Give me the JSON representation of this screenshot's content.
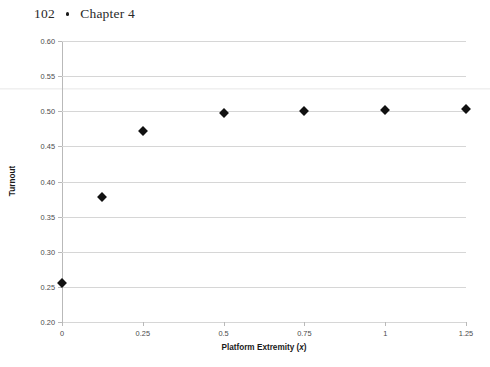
{
  "page_header": {
    "folio": "102",
    "separator_icon": "bullet-dot",
    "chapter_label": "Chapter 4"
  },
  "chart_data": {
    "type": "scatter",
    "title": "",
    "xlabel_prefix": "Platform Extremity (",
    "xlabel_variable": "x",
    "xlabel_suffix": ")",
    "ylabel": "Turnout",
    "x": [
      0,
      0.125,
      0.25,
      0.5,
      0.75,
      1.0,
      1.25
    ],
    "values": [
      0.255,
      0.378,
      0.472,
      0.498,
      0.5,
      0.502,
      0.503
    ],
    "xlim": [
      0,
      1.25
    ],
    "ylim": [
      0.2,
      0.6
    ],
    "xticks": [
      0,
      0.25,
      0.5,
      0.75,
      1,
      1.25
    ],
    "xtick_labels": [
      "0",
      "0.25",
      "0.5",
      "0.75",
      "1",
      "1.25"
    ],
    "yticks": [
      0.2,
      0.25,
      0.3,
      0.35,
      0.4,
      0.45,
      0.5,
      0.55,
      0.6
    ],
    "ytick_labels": [
      "0.20",
      "0.25",
      "0.30",
      "0.35",
      "0.40",
      "0.45",
      "0.50",
      "0.55",
      "0.60"
    ],
    "grid": "horizontal",
    "legend": "none",
    "marker": "diamond",
    "marker_color": "#111111",
    "gridline_color": "#d6d6d6"
  }
}
